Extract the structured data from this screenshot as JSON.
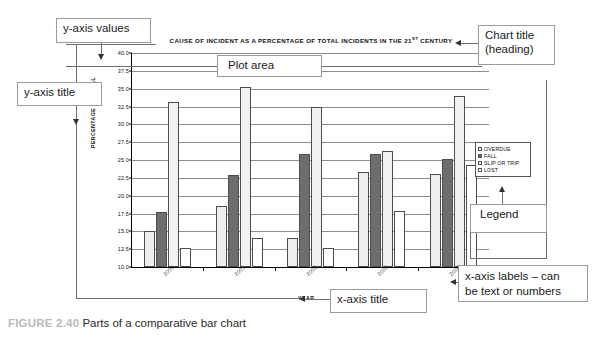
{
  "caption": {
    "figure_number": "FIGURE 2.40",
    "text": "Parts of a comparative bar chart"
  },
  "annotations": {
    "y_axis_values": "y-axis values",
    "y_axis_title": "y-axis title",
    "plot_area": "Plot area",
    "chart_title": "Chart title\n(heading)",
    "legend": "Legend",
    "x_axis_labels": "x-axis labels – can\nbe text or numbers",
    "x_axis_title": "x-axis title"
  },
  "chart_data": {
    "type": "bar",
    "title": "CAUSE OF INCIDENT AS A PERCENTAGE OF TOTAL INCIDENTS IN THE 21ST CENTURY",
    "title_prefix": "CAUSE OF INCIDENT AS A PERCENTAGE OF TOTAL INCIDENTS IN THE 21",
    "title_superscript": "ST",
    "title_suffix": " CENTURY",
    "xlabel": "YEAR",
    "ylabel": "PERCENTAGE OF TOTAL",
    "categories": [
      "2000",
      "2001",
      "2002",
      "2003",
      "2004"
    ],
    "ylim": [
      10.0,
      40.0
    ],
    "yticks": [
      "40.0",
      "37.5",
      "35.0",
      "32.5",
      "30.0",
      "27.5",
      "25.0",
      "22.5",
      "20.0",
      "17.5",
      "15.0",
      "12.5",
      "10.0"
    ],
    "ytick_values": [
      40.0,
      37.5,
      35.0,
      32.5,
      30.0,
      27.5,
      25.0,
      22.5,
      20.0,
      17.5,
      15.0,
      12.5,
      10.0
    ],
    "grid": true,
    "legend_position": "right",
    "series": [
      {
        "name": "OVERDUE",
        "fill": "fill-overdue",
        "values": [
          15.0,
          18.6,
          14.1,
          23.3,
          23.0
        ]
      },
      {
        "name": "FALL",
        "fill": "fill-fall",
        "values": [
          17.7,
          22.9,
          25.8,
          25.8,
          25.1
        ]
      },
      {
        "name": "SLIP OR TRIP",
        "fill": "fill-slip",
        "values": [
          33.1,
          35.2,
          32.5,
          26.3,
          34.0
        ]
      },
      {
        "name": "LOST",
        "fill": "fill-lost",
        "values": [
          12.6,
          14.0,
          12.6,
          17.9,
          24.3
        ]
      }
    ]
  }
}
